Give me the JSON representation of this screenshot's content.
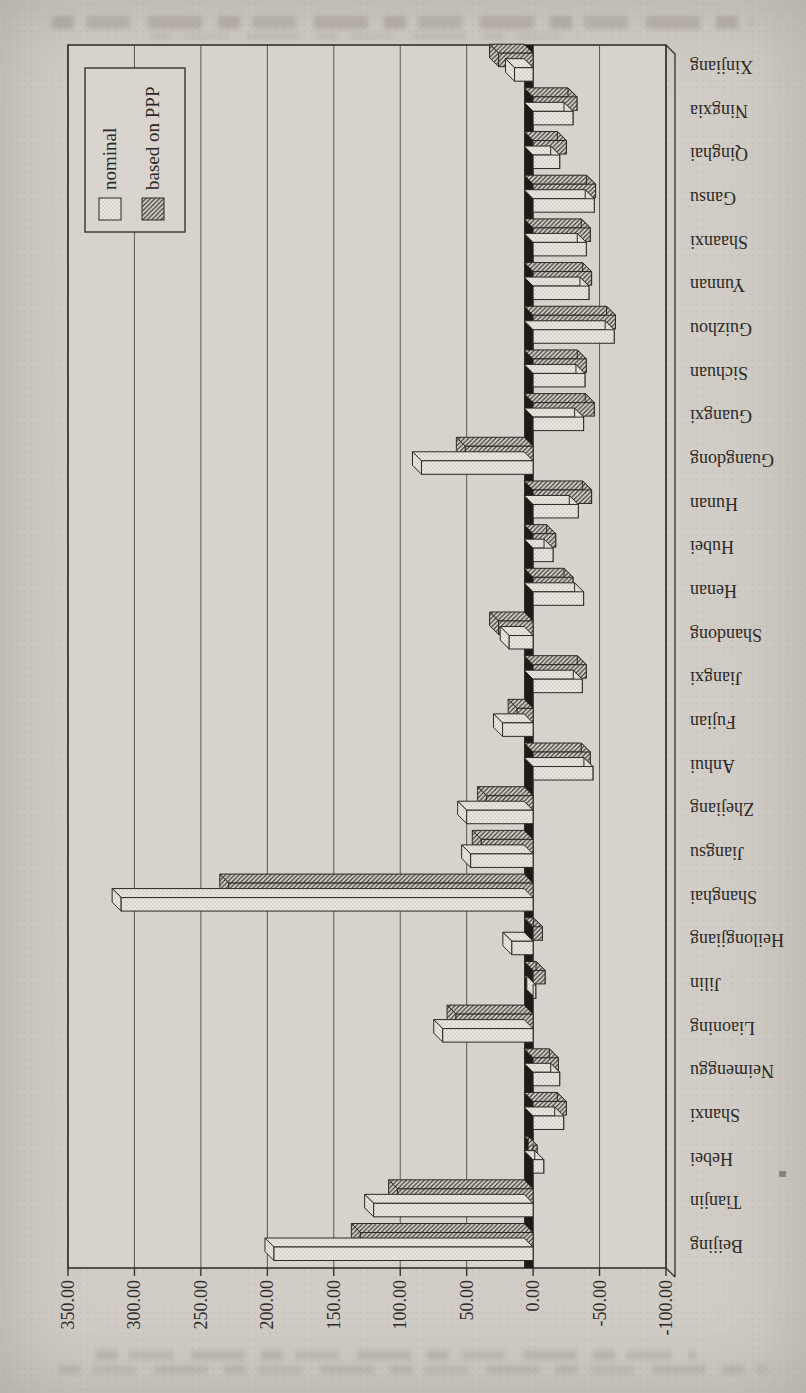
{
  "page": {
    "kind": "scanned book page with rotated chart",
    "background": "#d2cec7"
  },
  "chart_data": {
    "type": "bar",
    "style": "excel-3d-clustered, chart rotated 90deg counter-clockwise on page, positive bars point left",
    "title": "",
    "xlabel": "",
    "ylabel": "",
    "grid": true,
    "value_axis": {
      "min": -100,
      "max": 350,
      "step": 50,
      "tick_labels": [
        "350.00",
        "300.00",
        "250.00",
        "200.00",
        "150.00",
        "100.00",
        "50.00",
        "0.00",
        "-50.00",
        "-100.00"
      ]
    },
    "categories": [
      "Beijing",
      "Tianjin",
      "Hebei",
      "Shanxi",
      "Neimenggu",
      "Liaoning",
      "Jilin",
      "Heilongjiang",
      "Shanghai",
      "Jiangsu",
      "Zhejiang",
      "Anhui",
      "Fujian",
      "Jiangxi",
      "Shandong",
      "Henan",
      "Hubei",
      "Hunan",
      "Guangdong",
      "Guangxi",
      "Sichuan",
      "Guizhou",
      "Yunnan",
      "Shaanxi",
      "Gansu",
      "Qinghai",
      "Ningxia",
      "Xinjiang"
    ],
    "series": [
      {
        "name": "nominal",
        "pattern": "light-stipple",
        "values": [
          195,
          120,
          -8,
          -23,
          -20,
          68,
          -2,
          16,
          310,
          47,
          50,
          -45,
          23,
          -37,
          18,
          -38,
          -15,
          -34,
          84,
          -38,
          -39,
          -61,
          -42,
          -40,
          -46,
          -20,
          -30,
          14
        ]
      },
      {
        "name": "based on PPP",
        "pattern": "diagonal-hatch",
        "values": [
          130,
          102,
          -3,
          -25,
          -19,
          58,
          -9,
          -7,
          229,
          39,
          35,
          -43,
          12,
          -40,
          26,
          -30,
          -17,
          -44,
          51,
          -46,
          -40,
          -62,
          -44,
          -43,
          -47,
          -25,
          -33,
          26
        ]
      }
    ],
    "legend": {
      "position": "top-right-of-plot",
      "entries": [
        "nominal",
        "based on PPP"
      ]
    },
    "colors": {
      "ink": "#2b2925",
      "frame": "#35322d",
      "grid": "#5a554e",
      "plot_bg": "#d7d3cc",
      "axis_wall": "#1c1b19",
      "nominal_bg": "#eae7e0",
      "nominal_dot": "#9b968d",
      "ppp_bg": "#d8d4cd",
      "ppp_line": "#3b3732",
      "legend_bg": "#d9d5ce"
    }
  }
}
